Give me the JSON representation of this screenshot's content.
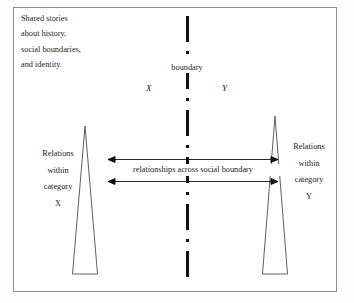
{
  "figure": {
    "shared_stories_caption": {
      "lines": [
        "Shared stories",
        "about history,",
        "social boundaries,",
        "and identity."
      ]
    },
    "boundary": {
      "label": "boundary",
      "line_style": "dash-dot-vertical",
      "color": "#111111"
    },
    "categories": {
      "left": {
        "letter": "X",
        "relations_lines": [
          "Relations",
          "within",
          "category",
          "X"
        ]
      },
      "right": {
        "letter": "Y",
        "relations_lines": [
          "Relations",
          "within",
          "category",
          "Y"
        ]
      }
    },
    "cross_boundary": {
      "caption": "relationships across social boundary",
      "arrow_count": 2,
      "arrow_style": "double-headed"
    },
    "colors": {
      "frame": "#8d8d8d",
      "cone_stroke": "#5f5f5f",
      "text": "#1d1d1d",
      "background": "#ffffff"
    }
  }
}
